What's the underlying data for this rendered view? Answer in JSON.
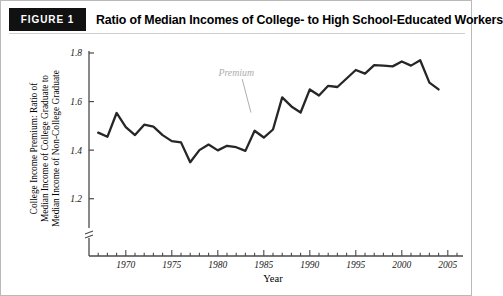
{
  "figure": {
    "badge_label": "FIGURE 1",
    "title": "Ratio of Median Incomes of College- to High School-Educated Workers"
  },
  "chart_data": {
    "type": "line",
    "title": "Ratio of Median Incomes of College- to High School-Educated Workers",
    "xlabel": "Year",
    "ylabel": "College Income Premium: Ratio of Median Income of College Graduate to Median Income of Non-College Graduate",
    "ylabel_lines": [
      "College Income Premium: Ratio of",
      "Median Income of College Graduate to",
      "Median Income of Non-College Graduate"
    ],
    "xlim": [
      1966,
      2006
    ],
    "ylim": [
      1.1,
      1.8
    ],
    "axis_break": true,
    "grid": false,
    "legend": "none",
    "ytick_labels": [
      "1.2",
      "1.4",
      "1.6",
      "1.8"
    ],
    "ytick_values": [
      1.2,
      1.4,
      1.6,
      1.8
    ],
    "xtick_labels": [
      "1970",
      "1975",
      "1980",
      "1985",
      "1990",
      "1995",
      "2000",
      "2005"
    ],
    "xtick_values": [
      1970,
      1975,
      1980,
      1985,
      1990,
      1995,
      2000,
      2005
    ],
    "xtick_minor_step": 1,
    "line_color": "#262626",
    "annotations": [
      {
        "text": "Premium",
        "x": 1982.0,
        "y": 1.705,
        "color": "#aeaeae",
        "leader_to_x": 1983.6,
        "leader_to_y": 1.555
      }
    ],
    "series": [
      {
        "name": "College income premium",
        "x": [
          1967,
          1968,
          1969,
          1970,
          1971,
          1972,
          1973,
          1974,
          1975,
          1976,
          1977,
          1978,
          1979,
          1980,
          1981,
          1982,
          1983,
          1984,
          1985,
          1986,
          1987,
          1988,
          1989,
          1990,
          1991,
          1992,
          1993,
          1994,
          1995,
          1996,
          1997,
          1998,
          1999,
          2000,
          2001,
          2002,
          2003,
          2004
        ],
        "values": [
          1.472,
          1.455,
          1.553,
          1.495,
          1.462,
          1.505,
          1.497,
          1.462,
          1.437,
          1.432,
          1.35,
          1.4,
          1.423,
          1.399,
          1.418,
          1.412,
          1.397,
          1.48,
          1.452,
          1.485,
          1.617,
          1.58,
          1.555,
          1.65,
          1.625,
          1.665,
          1.66,
          1.695,
          1.73,
          1.715,
          1.75,
          1.748,
          1.745,
          1.765,
          1.748,
          1.77,
          1.678,
          1.65
        ]
      }
    ]
  }
}
